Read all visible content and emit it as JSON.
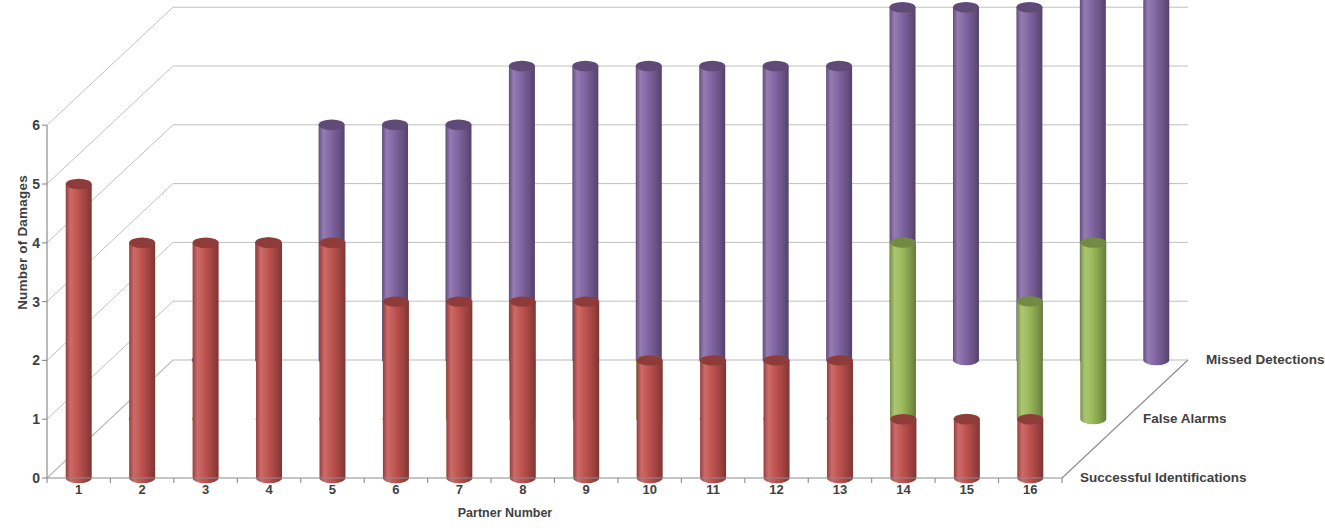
{
  "chart_data": {
    "type": "bar",
    "render": "3d-cylinder",
    "title": "",
    "xlabel": "Partner Number",
    "ylabel": "Number of Damages",
    "categories": [
      "1",
      "2",
      "3",
      "4",
      "5",
      "6",
      "7",
      "8",
      "9",
      "10",
      "11",
      "12",
      "13",
      "14",
      "15",
      "16"
    ],
    "ylim": [
      0,
      6
    ],
    "yticks": [
      0,
      1,
      2,
      3,
      4,
      5,
      6
    ],
    "grid": true,
    "legend_position": "right-depth-axis",
    "series": [
      {
        "name": "Successful Identifications",
        "color": "#C0504D",
        "depth_row": 0,
        "values": [
          5,
          4,
          4,
          4,
          4,
          3,
          3,
          3,
          3,
          2,
          2,
          2,
          2,
          1,
          1,
          1
        ]
      },
      {
        "name": "False Alarms",
        "color": "#9BBB59",
        "depth_row": 1,
        "values": [
          0,
          0,
          0,
          0,
          0,
          1,
          1,
          1,
          1,
          0,
          0,
          0,
          3,
          0,
          2,
          3
        ]
      },
      {
        "name": "Missed Detections",
        "color": "#8064A2",
        "depth_row": 2,
        "values": [
          0,
          2,
          4,
          4,
          4,
          5,
          5,
          5,
          5,
          5,
          5,
          6,
          6,
          6,
          7,
          7
        ]
      }
    ]
  },
  "axis": {
    "y_title": "Number of Damages",
    "x_title": "Partner Number"
  },
  "legend": {
    "items": [
      {
        "label": "Missed Detections"
      },
      {
        "label": "False Alarms"
      },
      {
        "label": "Successful Identifications"
      }
    ]
  },
  "colors": {
    "successful_identifications": "#C0504D",
    "false_alarms": "#9BBB59",
    "missed_detections": "#8064A2",
    "grid": "#b9b9b9",
    "axis": "#8c8c8c",
    "text": "#3f3f3f"
  }
}
